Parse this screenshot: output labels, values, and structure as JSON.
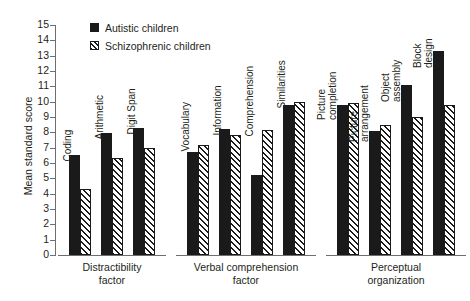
{
  "chart_data": {
    "type": "bar",
    "title": "",
    "xlabel": "",
    "ylabel": "Mean standard score",
    "ylim": [
      0,
      15
    ],
    "ytick_step": 1,
    "grid": false,
    "legend_position": "top-left",
    "ytick_labels": [
      "15",
      "14",
      "13",
      "12",
      "11",
      "10",
      "9",
      "8",
      "7",
      "6",
      "5",
      "4",
      "3",
      "2",
      "1",
      "0"
    ],
    "series": [
      {
        "name": "Autistic children",
        "color": "#1a1a1a",
        "pattern": "solid",
        "values": [
          6.55,
          7.95,
          8.3,
          6.7,
          8.2,
          5.2,
          9.8,
          9.8,
          8.1,
          11.1,
          13.3
        ]
      },
      {
        "name": "Schizophrenic children",
        "color": "#1a1a1a",
        "pattern": "diagonal-hatch",
        "values": [
          4.3,
          6.35,
          7.0,
          7.2,
          7.85,
          8.15,
          10.0,
          9.9,
          8.5,
          9.0,
          9.8
        ]
      }
    ],
    "categories": [
      "Coding",
      "Arithmetic",
      "Digit Span",
      "Vocabulary",
      "Information",
      "Comprehension",
      "Similarities",
      "Picture\ncompletion",
      "Picture\narrangement",
      "Object\nassembly",
      "Block\ndesign"
    ],
    "groups": [
      {
        "label": "Distractibility\nfactor",
        "categories": [
          "Coding",
          "Arithmetic",
          "Digit Span"
        ]
      },
      {
        "label": "Verbal comprehension\nfactor",
        "categories": [
          "Vocabulary",
          "Information",
          "Comprehension",
          "Similarities"
        ]
      },
      {
        "label": "Perceptual\norganization",
        "categories": [
          "Picture\ncompletion",
          "Picture\narrangement",
          "Object\nassembly",
          "Block\ndesign"
        ]
      }
    ]
  }
}
